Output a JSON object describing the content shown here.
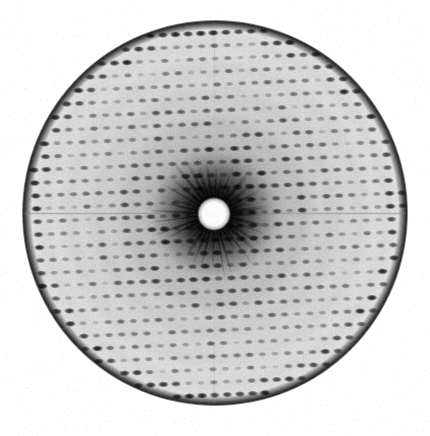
{
  "image": {
    "title": "X-ray Diffraction Pattern",
    "kind": "x-ray-diffraction-photograph",
    "width": 430,
    "height": 436,
    "background_color": "#ffffff",
    "caption": "",
    "labels": []
  },
  "chart_data": {
    "type": "scatter",
    "title": "X-ray Diffraction Pattern",
    "subtitle": "",
    "xlabel": "",
    "ylabel": "",
    "annotations": [],
    "legend": [],
    "grid": false,
    "axis_visible": false,
    "tick_labels": [],
    "description": "Single-crystal X-ray oscillation photograph: a circular film disc carrying a regular reciprocal-lattice array of dark diffraction spots, a bright circular beamstop shadow at the direct-beam center, and a dark diffuse halo fading outward.",
    "detector": {
      "film_shape": "circle",
      "center_x": 215,
      "center_y": 213,
      "radius": 192,
      "film_base_gray": "#d9d9d9",
      "rim_color": "#303030",
      "rim_thickness": 4,
      "edge_softness": 3
    },
    "beamstop": {
      "shape": "circle",
      "center_x": 214,
      "center_y": 214,
      "radius": 14,
      "fill_color": "#fbfbfb",
      "edge_softness": 3,
      "halo_radius": 62,
      "halo_color": "#141414",
      "halo_strength": 0.92
    },
    "lattice": {
      "a_vector": [
        12.6,
        -0.55
      ],
      "b_vector": [
        0.95,
        12.9
      ],
      "origin_x": 214,
      "origin_y": 214,
      "h_range": [
        -18,
        18
      ],
      "k_range": [
        -18,
        18
      ],
      "spot_shape": "ellipse",
      "spot_rx": 3.3,
      "spot_ry": 1.85,
      "spot_color": "#0c0c0c",
      "spot_blur": 0.8,
      "systematic_absence_period": 0
    },
    "intensity_profile": {
      "model": "radial-falloff-with-resolution-shells",
      "center_intensity": 1.0,
      "mid_intensity": 0.62,
      "edge_intensity": 0.32,
      "shell_radii": [
        34,
        60,
        88,
        117,
        146,
        172
      ],
      "shell_boost": [
        0.9,
        0.75,
        0.62,
        0.55,
        0.5,
        0.62
      ]
    },
    "background_fog": {
      "model": "radial-gradient",
      "center_gray": 40,
      "inner_gray": 150,
      "mid_gray": 205,
      "outer_gray": 222,
      "rim_gray": 96
    },
    "equator": {
      "present": true,
      "y": 213,
      "line_gray": 140,
      "spot_boost": 1.35,
      "thickness": 1.5
    },
    "meridian": {
      "present": true,
      "x": 214,
      "line_gray": 175,
      "spot_boost": 1.12,
      "thickness": 1.2
    },
    "radial_streaks": {
      "present": true,
      "count": 36,
      "inner_radius": 16,
      "outer_radius": 58,
      "color": "#0a0a0a"
    },
    "film_grain": {
      "present": true,
      "amplitude": 13,
      "seed": 20240517
    }
  }
}
